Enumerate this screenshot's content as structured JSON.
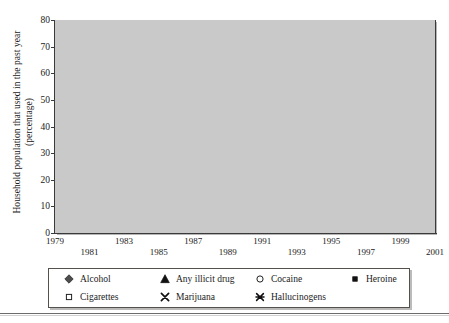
{
  "figure": {
    "ylabel_line1": "Household population that used in the past year",
    "ylabel_line2": "(percentage)"
  },
  "legend": {
    "items": [
      {
        "label": "Alcohol",
        "marker": "diamond-filled-icon",
        "color": "#4d4d4d"
      },
      {
        "label": "Any illicit drug",
        "marker": "triangle-filled-icon",
        "color": "#111111"
      },
      {
        "label": "Cocaine",
        "marker": "circle-open-icon",
        "color": "#2b2b2b"
      },
      {
        "label": "Heroine",
        "marker": "square-filled-icon",
        "color": "#111111"
      },
      {
        "label": "Cigarettes",
        "marker": "square-open-icon",
        "color": "#2b2b2b"
      },
      {
        "label": "Marijuana",
        "marker": "x-cross-icon",
        "color": "#111111"
      },
      {
        "label": "Hallucinogens",
        "marker": "asterisk-cross-icon",
        "color": "#111111"
      }
    ]
  },
  "chart_data": {
    "type": "line",
    "title": "",
    "xlabel": "",
    "ylabel": "Household population that used in the past year (percentage)",
    "xlim": [
      1979,
      2001
    ],
    "ylim": [
      0,
      80
    ],
    "yticks": [
      0,
      10,
      20,
      30,
      40,
      50,
      60,
      70,
      80
    ],
    "xticks": [
      1979,
      1981,
      1983,
      1985,
      1987,
      1989,
      1991,
      1993,
      1995,
      1997,
      1999,
      2001
    ],
    "xtick_rows": {
      "top": [
        1979,
        1983,
        1987,
        1991,
        1995,
        1999
      ],
      "bottom": [
        1981,
        1985,
        1989,
        1993,
        1997,
        2001
      ]
    },
    "grid": true,
    "grid_color": "#ffffff",
    "plot_background": "#c9c9c9",
    "legend_position": "below-axes",
    "series": [
      {
        "name": "Alcohol",
        "marker": "diamond-filled-icon",
        "color": "#4d4d4d",
        "x": [
          1979,
          1982,
          1985,
          1988,
          1990,
          1991,
          1992,
          1993,
          1994,
          1995,
          1996,
          1997,
          1998,
          1999,
          2000,
          2001
        ],
        "values": [
          72.7,
          67.9,
          73.0,
          68.3,
          66.2,
          68.4,
          64.8,
          66.6,
          67.0,
          65.6,
          65.1,
          64.4,
          64.1,
          62.5,
          62.3,
          64.2
        ]
      },
      {
        "name": "Cigarettes",
        "marker": "square-open-icon",
        "color": "#2b2b2b",
        "x": [
          1985,
          1988,
          1990,
          1991,
          1992,
          1993,
          1994,
          1995,
          1996,
          1997,
          1998,
          1999,
          2000,
          2001
        ],
        "values": [
          40.6,
          38.8,
          36.2,
          36.3,
          35.5,
          33.4,
          31.9,
          32.1,
          32.4,
          32.9,
          30.7,
          30.6,
          29.4,
          29.5
        ]
      },
      {
        "name": "Any illicit drug",
        "marker": "triangle-filled-icon",
        "color": "#111111",
        "x": [
          1979,
          1982,
          1985,
          1988,
          1990,
          1991,
          1992,
          1993,
          1994,
          1995,
          1996,
          1997,
          1998,
          1999,
          2000,
          2001
        ],
        "values": [
          17.2,
          16.1,
          16.0,
          11.8,
          11.4,
          11.2,
          10.0,
          9.7,
          10.3,
          10.8,
          10.7,
          11.0,
          11.1,
          11.1,
          11.3,
          12.6
        ]
      },
      {
        "name": "Marijuana",
        "marker": "x-cross-icon",
        "color": "#111111",
        "x": [
          1979,
          1982,
          1985,
          1988,
          1990,
          1991,
          1992,
          1993,
          1994,
          1995,
          1996,
          1997,
          1998,
          1999,
          2000,
          2001
        ],
        "values": [
          17.0,
          16.0,
          14.1,
          10.2,
          9.7,
          9.6,
          8.8,
          9.0,
          8.9,
          9.2,
          9.1,
          9.3,
          9.1,
          9.1,
          9.0,
          9.8
        ]
      },
      {
        "name": "Cocaine",
        "marker": "circle-open-icon",
        "color": "#2b2b2b",
        "x": [
          1979,
          1982,
          1985,
          1988,
          1990,
          1991,
          1992,
          1993,
          1994,
          1995,
          1996,
          1997,
          1998,
          1999,
          2000,
          2001
        ],
        "values": [
          4.6,
          5.7,
          5.0,
          3.4,
          2.8,
          2.7,
          2.2,
          2.0,
          2.0,
          2.1,
          2.0,
          2.1,
          2.1,
          2.2,
          2.2,
          2.3
        ]
      },
      {
        "name": "Hallucinogens",
        "marker": "asterisk-cross-icon",
        "color": "#111111",
        "x": [
          1979,
          1982,
          1985,
          1988,
          1990,
          1991,
          1992,
          1993,
          1994,
          1995,
          1996,
          1997,
          1998,
          1999,
          2000,
          2001
        ],
        "values": [
          2.2,
          2.0,
          1.8,
          1.6,
          1.5,
          1.4,
          1.3,
          1.4,
          1.5,
          1.6,
          1.6,
          1.7,
          1.7,
          1.7,
          1.7,
          1.8
        ]
      },
      {
        "name": "Heroine",
        "marker": "square-filled-icon",
        "color": "#111111",
        "x": [
          1979,
          1982,
          1985,
          1988,
          1990,
          1991,
          1992,
          1993,
          1994,
          1995,
          1996,
          1997,
          1998,
          1999,
          2000,
          2001
        ],
        "values": [
          0.3,
          0.3,
          0.3,
          0.3,
          0.3,
          0.3,
          0.2,
          0.2,
          0.2,
          0.2,
          0.3,
          0.3,
          0.3,
          0.3,
          0.3,
          0.4
        ]
      }
    ]
  }
}
